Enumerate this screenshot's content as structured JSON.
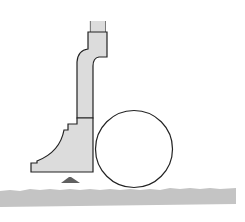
{
  "diagram": {
    "colors": {
      "fill": "#dcdcdc",
      "stroke": "#222222",
      "ground": "#c4c4c4",
      "marker": "#606060",
      "circle_fill": "#ffffff"
    },
    "elements": [
      {
        "name": "profile-body",
        "type": "shape"
      },
      {
        "name": "round-tube",
        "type": "circle"
      },
      {
        "name": "support-marker",
        "type": "triangle"
      },
      {
        "name": "ground-strip",
        "type": "band"
      }
    ]
  }
}
